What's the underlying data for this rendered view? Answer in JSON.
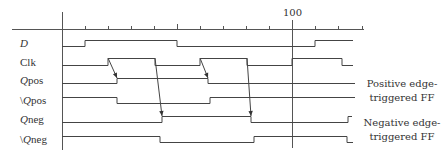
{
  "diagram": {
    "type": "timing-diagram",
    "axis": {
      "major_tick_label": "100",
      "major_tick_x": 292,
      "tick_xs": [
        85,
        108,
        131,
        154,
        177,
        200,
        223,
        246,
        269,
        292,
        315,
        338,
        362
      ]
    },
    "signals": [
      {
        "name": "D",
        "prefix": "",
        "italic": "D",
        "rest": "",
        "y_high": 40,
        "y_low": 46,
        "points": [
          [
            62,
            "low"
          ],
          [
            85,
            "high"
          ],
          [
            177,
            "low"
          ],
          [
            315,
            "high"
          ],
          [
            353,
            "high"
          ]
        ]
      },
      {
        "name": "Clk",
        "prefix": "",
        "italic": "",
        "rest": "Clk",
        "y_high": 58,
        "y_low": 65,
        "points": [
          [
            62,
            "low"
          ],
          [
            108,
            "high"
          ],
          [
            155,
            "low"
          ],
          [
            200,
            "high"
          ],
          [
            247,
            "low"
          ],
          [
            292,
            "high"
          ],
          [
            342,
            "low"
          ],
          [
            353,
            "low"
          ]
        ]
      },
      {
        "name": "Qpos",
        "prefix": "",
        "italic": "Q",
        "rest": "pos",
        "y_high": 78,
        "y_low": 83,
        "points": [
          [
            62,
            "low"
          ],
          [
            117,
            "high"
          ],
          [
            208,
            "low"
          ],
          [
            355,
            "low"
          ]
        ]
      },
      {
        "name": "\\Qpos",
        "prefix": "\\",
        "italic": "Q",
        "rest": "pos",
        "y_high": 97,
        "y_low": 103,
        "points": [
          [
            62,
            "high"
          ],
          [
            117,
            "low"
          ],
          [
            210,
            "high"
          ],
          [
            355,
            "high"
          ]
        ]
      },
      {
        "name": "Qneg",
        "prefix": "",
        "italic": "Q",
        "rest": "neg",
        "y_high": 116,
        "y_low": 122,
        "points": [
          [
            62,
            "low"
          ],
          [
            162,
            "high"
          ],
          [
            251,
            "low"
          ],
          [
            348,
            "high"
          ],
          [
            352,
            "high"
          ]
        ]
      },
      {
        "name": "\\Qneg",
        "prefix": "\\",
        "italic": "Q",
        "rest": "neg",
        "y_high": 136,
        "y_low": 142,
        "points": [
          [
            62,
            "high"
          ],
          [
            160,
            "low"
          ],
          [
            254,
            "high"
          ],
          [
            347,
            "low"
          ],
          [
            353,
            "low"
          ]
        ]
      }
    ],
    "arrows": [
      {
        "from": [
          108,
          58
        ],
        "to": [
          117,
          78
        ]
      },
      {
        "from": [
          200,
          58
        ],
        "to": [
          208,
          78
        ]
      },
      {
        "from": [
          155,
          58
        ],
        "to": [
          162,
          116
        ]
      },
      {
        "from": [
          247,
          58
        ],
        "to": [
          251,
          116
        ]
      }
    ],
    "annotations": [
      {
        "line1": "Positive edge-",
        "line2": "triggered FF"
      },
      {
        "line1": "Negative edge-",
        "line2": "triggered FF"
      }
    ],
    "stroke_color": "#444444"
  }
}
